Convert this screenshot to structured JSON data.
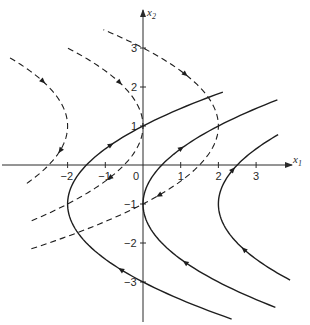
{
  "figure": {
    "x_axis_label": "x",
    "x_axis_sub": "1",
    "y_axis_label": "x",
    "y_axis_sub": "2",
    "origin_label": "0",
    "x_ticks": [
      {
        "value": -2,
        "label": "−2"
      },
      {
        "value": -1,
        "label": "−1"
      },
      {
        "value": 1,
        "label": "1"
      },
      {
        "value": 2,
        "label": "2"
      },
      {
        "value": 3,
        "label": "3"
      }
    ],
    "y_ticks": [
      {
        "value": 3,
        "label": "3"
      },
      {
        "value": 2,
        "label": "2"
      },
      {
        "value": 1,
        "label": "1"
      },
      {
        "value": -1,
        "label": "−1"
      },
      {
        "value": -2,
        "label": "−2"
      },
      {
        "value": -3,
        "label": "−3"
      }
    ],
    "line_color": "#1e1e1e",
    "background": "#ffffff"
  },
  "curves": {
    "solid_family": {
      "equation": "x1 = c + (x2 + 1)^2 / 2",
      "style": "solid",
      "direction": "upward (increasing x2)",
      "members": [
        {
          "c": -2,
          "vertex": [
            -2,
            -1
          ],
          "x2_range": [
            -3.95,
            1.87
          ]
        },
        {
          "c": 0,
          "vertex": [
            0,
            -1
          ],
          "x2_range": [
            -3.65,
            1.67
          ]
        },
        {
          "c": 2,
          "vertex": [
            2,
            -1
          ],
          "x2_range": [
            -2.95,
            0.78
          ]
        }
      ]
    },
    "dashed_family": {
      "equation": "x1 = c - (x2 - 1)^2 / 2",
      "style": "dashed",
      "direction": "downward (decreasing x2)",
      "members": [
        {
          "c": -2,
          "vertex": [
            -2,
            1
          ],
          "x2_range": [
            -0.47,
            2.78
          ]
        },
        {
          "c": 0,
          "vertex": [
            0,
            1
          ],
          "x2_range": [
            -1.43,
            3.0
          ]
        },
        {
          "c": 2,
          "vertex": [
            2,
            1
          ],
          "x2_range": [
            -2.15,
            3.47
          ]
        }
      ]
    }
  }
}
